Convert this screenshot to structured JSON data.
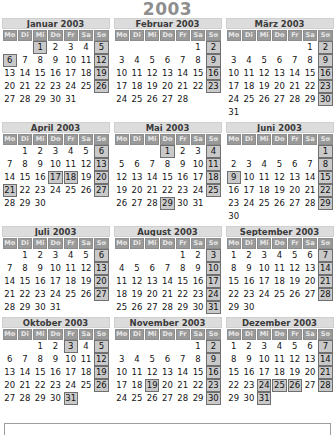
{
  "title": "2003",
  "locale_weekdays": [
    "Mo",
    "Di",
    "Mi",
    "Do",
    "Fr",
    "Sa",
    "So"
  ],
  "colors": {
    "title": "#8e8e8e",
    "month_header_bg": "#dcdcdc",
    "weekday_header_bg": "#9a9a9a",
    "weekday_header_text": "#e8e8e8",
    "highlight_bg": "#c9c9c9",
    "highlight_border": "#6f6f6f",
    "day_text": "#151515"
  },
  "calendar": {
    "year": 2003,
    "week_start": "Mo",
    "months": [
      {
        "name": "Januar 2003",
        "month_label": "Januar",
        "index": 1,
        "days": 31,
        "first_weekday_offset": 2,
        "highlighted": [
          1,
          5,
          6,
          12,
          19,
          26
        ]
      },
      {
        "name": "Februar 2003",
        "month_label": "Februar",
        "index": 2,
        "days": 28,
        "first_weekday_offset": 5,
        "highlighted": [
          2,
          9,
          16,
          23
        ]
      },
      {
        "name": "März 2003",
        "month_label": "März",
        "index": 3,
        "days": 31,
        "first_weekday_offset": 5,
        "highlighted": [
          2,
          9,
          16,
          23,
          30
        ]
      },
      {
        "name": "April 2003",
        "month_label": "April",
        "index": 4,
        "days": 30,
        "first_weekday_offset": 1,
        "highlighted": [
          6,
          13,
          17,
          18,
          20,
          21,
          27
        ]
      },
      {
        "name": "Mai 2003",
        "month_label": "Mai",
        "index": 5,
        "days": 31,
        "first_weekday_offset": 3,
        "highlighted": [
          1,
          4,
          11,
          18,
          25,
          29
        ]
      },
      {
        "name": "Juni 2003",
        "month_label": "Juni",
        "index": 6,
        "days": 30,
        "first_weekday_offset": 6,
        "highlighted": [
          1,
          8,
          9,
          15,
          22,
          29
        ]
      },
      {
        "name": "Juli 2003",
        "month_label": "Juli",
        "index": 7,
        "days": 31,
        "first_weekday_offset": 1,
        "highlighted": [
          6,
          13,
          20,
          27
        ]
      },
      {
        "name": "August 2003",
        "month_label": "August",
        "index": 8,
        "days": 31,
        "first_weekday_offset": 4,
        "highlighted": [
          3,
          10,
          17,
          24,
          31
        ]
      },
      {
        "name": "September 2003",
        "month_label": "September",
        "index": 9,
        "days": 30,
        "first_weekday_offset": 0,
        "highlighted": [
          7,
          14,
          21,
          28
        ]
      },
      {
        "name": "Oktober 2003",
        "month_label": "Oktober",
        "index": 10,
        "days": 31,
        "first_weekday_offset": 2,
        "highlighted": [
          3,
          5,
          12,
          19,
          26,
          31
        ]
      },
      {
        "name": "November 2003",
        "month_label": "November",
        "index": 11,
        "days": 30,
        "first_weekday_offset": 5,
        "highlighted": [
          2,
          9,
          16,
          19,
          23,
          30
        ]
      },
      {
        "name": "Dezember 2003",
        "month_label": "Dezember",
        "index": 12,
        "days": 31,
        "first_weekday_offset": 0,
        "highlighted": [
          7,
          14,
          21,
          24,
          25,
          26,
          28,
          31
        ]
      }
    ]
  }
}
